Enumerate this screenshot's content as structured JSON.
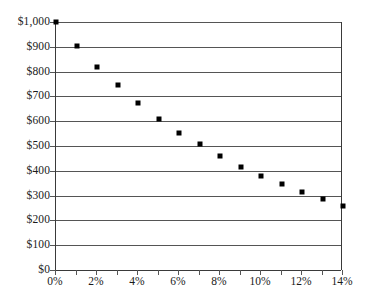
{
  "chart_data": {
    "type": "scatter",
    "title": "",
    "subtitle": "",
    "xlabel": "",
    "ylabel": "",
    "x": [
      0,
      1,
      2,
      3,
      4,
      5,
      6,
      7,
      8,
      9,
      10,
      11,
      12,
      13,
      14
    ],
    "values": [
      1000,
      905,
      820,
      745,
      675,
      610,
      553,
      508,
      458,
      417,
      378,
      345,
      315,
      287,
      258
    ],
    "x_unit": "%",
    "y_unit": "$",
    "xlim": [
      0,
      14
    ],
    "ylim": [
      0,
      1000
    ],
    "grid": "horizontal",
    "legend": "none",
    "marker_shape": "square",
    "marker_color": "#000000",
    "gridline_color": "#555555",
    "axis_color": "#3a3a3a",
    "background_color": "#ffffff",
    "y_ticks": [
      {
        "value": 1000,
        "label": "$1,000"
      },
      {
        "value": 900,
        "label": "$900"
      },
      {
        "value": 800,
        "label": "$800"
      },
      {
        "value": 700,
        "label": "$700"
      },
      {
        "value": 600,
        "label": "$600"
      },
      {
        "value": 500,
        "label": "$500"
      },
      {
        "value": 400,
        "label": "$400"
      },
      {
        "value": 300,
        "label": "$300"
      },
      {
        "value": 200,
        "label": "$200"
      },
      {
        "value": 100,
        "label": "$100"
      },
      {
        "value": 0,
        "label": "$0"
      }
    ],
    "x_ticks": [
      {
        "value": 0,
        "label": "0%"
      },
      {
        "value": 1,
        "label": ""
      },
      {
        "value": 2,
        "label": "2%"
      },
      {
        "value": 3,
        "label": ""
      },
      {
        "value": 4,
        "label": "4%"
      },
      {
        "value": 5,
        "label": ""
      },
      {
        "value": 6,
        "label": "6%"
      },
      {
        "value": 7,
        "label": ""
      },
      {
        "value": 8,
        "label": "8%"
      },
      {
        "value": 9,
        "label": ""
      },
      {
        "value": 10,
        "label": "10%"
      },
      {
        "value": 11,
        "label": ""
      },
      {
        "value": 12,
        "label": "12%"
      },
      {
        "value": 13,
        "label": ""
      },
      {
        "value": 14,
        "label": "14%"
      }
    ]
  }
}
